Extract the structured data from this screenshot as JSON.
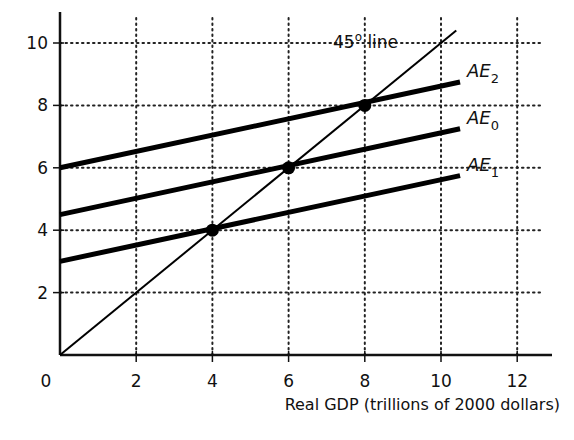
{
  "chart_data": {
    "type": "line",
    "title": "",
    "xlabel": "Real GDP (trillions of 2000 dollars)",
    "ylabel": "",
    "xlim": [
      0,
      13
    ],
    "ylim": [
      0,
      11
    ],
    "x_ticks": [
      0,
      2,
      4,
      6,
      8,
      10,
      12
    ],
    "y_ticks": [
      2,
      4,
      6,
      8,
      10
    ],
    "x_tick_labels": [
      "0",
      "2",
      "4",
      "6",
      "8",
      "10",
      "12"
    ],
    "y_tick_labels": [
      "2",
      "4",
      "6",
      "8",
      "10"
    ],
    "grid": "dotted",
    "series": [
      {
        "name": "45° line",
        "label": "45",
        "label_sup": "o",
        "label_suffix": " line",
        "x": [
          0,
          10.4
        ],
        "y": [
          0,
          10.4
        ],
        "width": 2
      },
      {
        "name": "AE2",
        "label": "AE",
        "sub": "2",
        "x": [
          0,
          10.5
        ],
        "y": [
          6,
          8.75
        ],
        "width": 5
      },
      {
        "name": "AE0",
        "label": "AE",
        "sub": "0",
        "x": [
          0,
          10.5
        ],
        "y": [
          4.5,
          7.25
        ],
        "width": 5
      },
      {
        "name": "AE1",
        "label": "AE",
        "sub": "1",
        "x": [
          0,
          10.5
        ],
        "y": [
          3,
          5.75
        ],
        "width": 5
      }
    ],
    "points": [
      {
        "x": 4,
        "y": 4
      },
      {
        "x": 6,
        "y": 6
      },
      {
        "x": 8,
        "y": 8
      }
    ]
  }
}
